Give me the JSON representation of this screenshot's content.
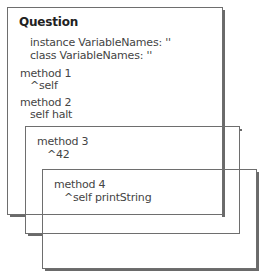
{
  "diagram": {
    "title": "Question",
    "class_definition": {
      "instance_vars": "instance VariableNames: ''",
      "class_vars": "class VariableNames: ''"
    },
    "methods": [
      {
        "name": "method 1",
        "body": "^self"
      },
      {
        "name": "method 2",
        "body": "self halt"
      },
      {
        "name": "method 3",
        "body": "^42"
      },
      {
        "name": "method 4",
        "body": "^self printString"
      }
    ],
    "colors": {
      "border": "#6e6e6e",
      "shadow": "#6a6a6a",
      "text": "#444444",
      "title": "#222222"
    }
  }
}
